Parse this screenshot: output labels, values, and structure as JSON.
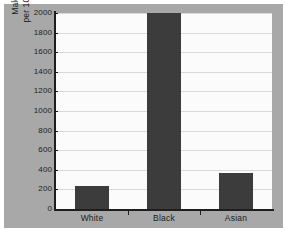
{
  "chart_data": {
    "type": "bar",
    "title": "",
    "subtitle": "",
    "xlabel": "",
    "ylabel_lines": [
      "Male prisoner population",
      "per 100,000 population 2000"
    ],
    "ylabel": "Male prisoner population per 100,000 population 2000",
    "categories": [
      "White",
      "Black",
      "Asian"
    ],
    "values": [
      230,
      2000,
      370
    ],
    "ylim": [
      0,
      2000
    ],
    "yticks": [
      0,
      200,
      400,
      600,
      800,
      1000,
      1200,
      1400,
      1600,
      1800,
      2000
    ],
    "ytick_labels": [
      "0",
      "200",
      "400",
      "600",
      "800",
      "1000",
      "1200",
      "1400",
      "1600",
      "1800",
      "2000"
    ],
    "grid": true,
    "grid_axis": "y",
    "legend": false,
    "bar_color": "#3c3c3c",
    "plot_background": "#fbfbfb",
    "panel_background": "#a8a8a8",
    "axis_color": "#1e1e1e",
    "gridline_color": "#d9d9d9"
  }
}
